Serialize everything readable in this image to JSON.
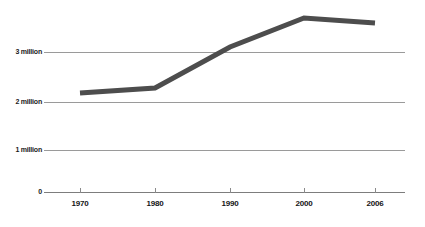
{
  "chart_data": {
    "type": "line",
    "title": "",
    "subtitle": "",
    "xlabel": "",
    "ylabel": "",
    "categories": [
      "1970",
      "1980",
      "1990",
      "2000",
      "2006"
    ],
    "x": [
      1970,
      1980,
      1990,
      2000,
      2006
    ],
    "values": [
      2180000,
      2280000,
      3100000,
      3680000,
      3580000
    ],
    "series": [
      {
        "name": "",
        "values": [
          2180000,
          2280000,
          3100000,
          3680000,
          3580000
        ]
      }
    ],
    "ylim": [
      0,
      4000000
    ],
    "xlim": [
      1966,
      2010
    ],
    "ytick_values": [
      0,
      1000000,
      2000000,
      3000000
    ],
    "ytick_labels": [
      "0",
      "1 million",
      "2 million",
      "3 million"
    ],
    "xtick_labels": [
      "1970",
      "1980",
      "1990",
      "2000",
      "2006"
    ],
    "grid": true,
    "grid_axis": "y",
    "legend": false,
    "legend_position": "none",
    "annotations": [],
    "line_color": "#4d4d4d",
    "grid_color": "#9a9a9a",
    "axis_color": "#7d7d7d",
    "background_color": "#ffffff",
    "text_color": "#1a1a1a",
    "line_width": 5,
    "markers": false
  },
  "axes": {
    "y": {
      "ticks": [
        {
          "label": "3 million",
          "value": 3000000,
          "y": 52
        },
        {
          "label": "2 million",
          "value": 2000000,
          "y": 102
        },
        {
          "label": "1 million",
          "value": 1000000,
          "y": 150
        },
        {
          "label": "0",
          "value": 0,
          "y": 192
        }
      ]
    },
    "x": {
      "ticks": [
        {
          "label": "1970",
          "value": 1970,
          "x": 80
        },
        {
          "label": "1980",
          "value": 1980,
          "x": 155
        },
        {
          "label": "1990",
          "value": 1990,
          "x": 230
        },
        {
          "label": "2000",
          "value": 2000,
          "x": 304
        },
        {
          "label": "2006",
          "value": 2006,
          "x": 375
        }
      ]
    }
  },
  "series_points": [
    {
      "x": 80,
      "y": 93
    },
    {
      "x": 155,
      "y": 88
    },
    {
      "x": 230,
      "y": 47
    },
    {
      "x": 304,
      "y": 18
    },
    {
      "x": 375,
      "y": 23
    }
  ]
}
